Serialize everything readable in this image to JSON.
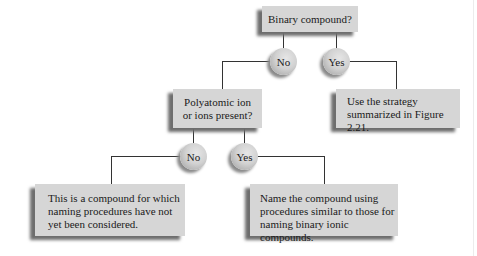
{
  "diagram": {
    "nodes": {
      "binary": {
        "label": "Binary compound?"
      },
      "binary_no": {
        "label": "No"
      },
      "binary_yes": {
        "label": "Yes"
      },
      "polyatomic": {
        "label": "Polyatomic ion\nor ions present?"
      },
      "strategy": {
        "label": "Use the strategy\nsummarized in Figure 2.21."
      },
      "poly_no": {
        "label": "No"
      },
      "poly_yes": {
        "label": "Yes"
      },
      "not_considered": {
        "label": "This is a compound for which\nnaming procedures have not\nyet been considered."
      },
      "name_compound": {
        "label": "Name the compound using\nprocedures similar to those for\nnaming binary ionic compounds."
      }
    },
    "edges": [
      {
        "from": "binary",
        "to": "binary_no"
      },
      {
        "from": "binary",
        "to": "binary_yes"
      },
      {
        "from": "binary_no",
        "to": "polyatomic"
      },
      {
        "from": "binary_yes",
        "to": "strategy"
      },
      {
        "from": "polyatomic",
        "to": "poly_no"
      },
      {
        "from": "polyatomic",
        "to": "poly_yes"
      },
      {
        "from": "poly_no",
        "to": "not_considered"
      },
      {
        "from": "poly_yes",
        "to": "name_compound"
      }
    ],
    "colors": {
      "box_fill": "#d6d6d6",
      "shadow": "#6e6e6e",
      "line": "#333333",
      "background": "#ffffff"
    }
  }
}
